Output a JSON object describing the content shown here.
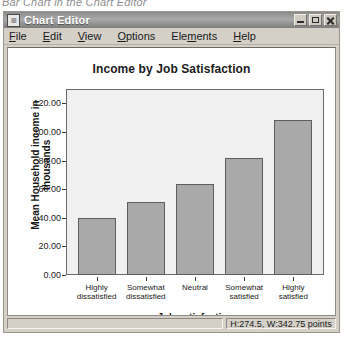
{
  "caption": "Bar Chart in the Chart Editor",
  "window": {
    "title": "Chart Editor",
    "icon": "chart-icon",
    "controls": {
      "minimize": "minimize-icon",
      "maximize": "maximize-icon",
      "close": "close-icon"
    }
  },
  "menubar": {
    "items": [
      {
        "label": "File",
        "mnemonic": "F",
        "rest": "ile"
      },
      {
        "label": "Edit",
        "mnemonic": "E",
        "rest": "dit"
      },
      {
        "label": "View",
        "mnemonic": "V",
        "rest": "iew"
      },
      {
        "label": "Options",
        "mnemonic": "O",
        "rest": "ptions"
      },
      {
        "label": "Elements",
        "pre": "Ele",
        "mnemonic": "m",
        "rest": "ents"
      },
      {
        "label": "Help",
        "mnemonic": "H",
        "rest": "elp"
      }
    ]
  },
  "statusbar": {
    "left": "",
    "right": "H:274.5, W:342.75 points"
  },
  "chart_data": {
    "type": "bar",
    "title": "Income by Job Satisfaction",
    "xlabel": "Job satisfaction",
    "ylabel": "Mean Household income in thousands",
    "ylabel_lines": [
      "Mean Household income in",
      "thousands"
    ],
    "categories": [
      "Highly dissatisfied",
      "Somewhat dissatisfied",
      "Neutral",
      "Somewhat satisfied",
      "Highly satisfied"
    ],
    "category_lines": [
      [
        "Highly",
        "dissatisfied"
      ],
      [
        "Somewhat",
        "dissatisfied"
      ],
      [
        "Neutral",
        ""
      ],
      [
        "Somewhat",
        "satisfied"
      ],
      [
        "Highly",
        "satisfied"
      ]
    ],
    "values": [
      40.0,
      51.0,
      63.5,
      81.5,
      108.0
    ],
    "ylim": [
      0,
      130
    ],
    "yticks": [
      0.0,
      20.0,
      40.0,
      60.0,
      80.0,
      100.0,
      120.0
    ],
    "ytick_labels": [
      "0.00",
      "20.00",
      "40.00",
      "60.00",
      "80.00",
      "100.00",
      "120.00"
    ],
    "grid": false,
    "legend": null,
    "bar_color": "#a9a9a9",
    "bar_border_color": "#5e5e5e",
    "plot_background": "#f0f0f0"
  }
}
